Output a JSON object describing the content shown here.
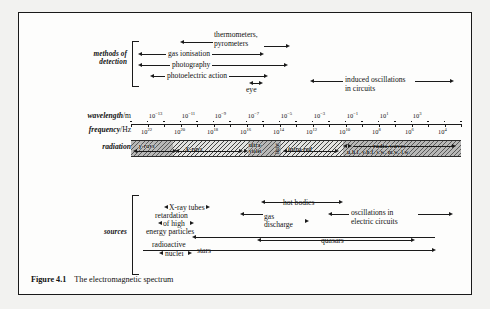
{
  "figure": {
    "caption_label": "Figure 4.1",
    "caption_text": "The electromagnetic spectrum",
    "border_color": "#1a1a1a",
    "background": "#fdfdfc"
  },
  "rows": {
    "detection_label_line1": "methods of",
    "detection_label_line2": "detection",
    "sources_label": "sources",
    "wavelength_label_italic": "wavelength",
    "wavelength_label_unit": "/m",
    "frequency_label_italic": "frequency",
    "frequency_label_unit": "/Hz",
    "radiation_label": "radiation"
  },
  "detection": {
    "items": [
      {
        "label": "thermometers,",
        "label2": "pyrometers"
      },
      {
        "label": "gas ionisation"
      },
      {
        "label": "photography"
      },
      {
        "label": "photoelectric action"
      },
      {
        "label": "eye"
      },
      {
        "label": "induced oscillations",
        "label2": "in circuits"
      }
    ]
  },
  "sources": {
    "items": [
      {
        "label": "X-ray tubes"
      },
      {
        "label": "retardation"
      },
      {
        "label": "of high"
      },
      {
        "label": "energy particles"
      },
      {
        "label": "hot bodies"
      },
      {
        "label": "gas"
      },
      {
        "label": "discharge"
      },
      {
        "label": "oscillations in"
      },
      {
        "label": "electric circuits"
      },
      {
        "label": "radioactive"
      },
      {
        "label": "nuclei"
      },
      {
        "label": "quasars"
      },
      {
        "label": "stars"
      }
    ]
  },
  "chart_data": {
    "type": "bar",
    "title": "The electromagnetic spectrum",
    "xlabel": "wavelength/m  and  frequency/Hz",
    "ylabel": "",
    "grid": false,
    "legend": "none",
    "axes": [
      {
        "name": "wavelength",
        "label": "wavelength/m",
        "unit": "m",
        "position": "top",
        "tick_labels": [
          "10⁻¹³",
          "10⁻¹¹",
          "10⁻⁹",
          "10⁻⁷",
          "10⁻⁵",
          "10⁻³",
          "10⁻¹",
          "10¹",
          "10³"
        ],
        "exponents": [
          -13,
          -11,
          -9,
          -7,
          -5,
          -3,
          -1,
          1,
          3
        ],
        "range": [
          -14,
          4
        ]
      },
      {
        "name": "frequency",
        "label": "frequency/Hz",
        "unit": "Hz",
        "position": "bottom",
        "tick_labels": [
          "10²²",
          "10²⁰",
          "10¹⁸",
          "10¹⁶",
          "10¹⁴",
          "10¹²",
          "10¹⁰",
          "10⁸",
          "10⁶",
          "10⁴"
        ],
        "exponents": [
          22,
          20,
          18,
          16,
          14,
          12,
          10,
          8,
          6,
          4
        ],
        "range": [
          23,
          3
        ]
      }
    ],
    "bands": [
      {
        "name": "γ-rays",
        "label": "γ-rays",
        "shaded": true
      },
      {
        "name": "X-rays",
        "label": "X-rays",
        "shaded": false
      },
      {
        "name": "ultra-violet",
        "label": "ultra-",
        "label2": "violet",
        "shaded": true
      },
      {
        "name": "light",
        "label": "light",
        "orientation": "vertical",
        "shaded": true
      },
      {
        "name": "infra-red",
        "label": "infra-red",
        "shaded": false
      },
      {
        "name": "radio waves",
        "label": "radio waves",
        "sub": "u.h.f.  v.h.f.  s.w.  m.w.  l.w.",
        "shaded": true
      }
    ],
    "radio_subbands": [
      "u.h.f.",
      "v.h.f.",
      "s.w.",
      "m.w.",
      "l.w."
    ]
  }
}
